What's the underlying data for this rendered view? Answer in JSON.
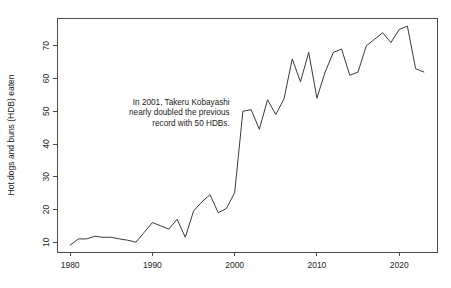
{
  "chart_data": {
    "type": "line",
    "title": "",
    "subtitle": "",
    "xlabel": "",
    "ylabel": "Hot dogs and buns (HDB) eaten",
    "xlim": [
      1978.4,
      2024.6
    ],
    "ylim": [
      7.0,
      78.5
    ],
    "grid": false,
    "legend": null,
    "x_ticks": [
      1980,
      1990,
      2000,
      2010,
      2020
    ],
    "x_tick_labels": [
      "1980",
      "1990",
      "2000",
      "2010",
      "2020"
    ],
    "y_ticks": [
      10,
      20,
      30,
      40,
      50,
      60,
      70
    ],
    "y_tick_labels": [
      "10",
      "20",
      "30",
      "40",
      "50",
      "60",
      "70"
    ],
    "series": [
      {
        "name": "Winning total (HDB)",
        "x": [
          1980,
          1981,
          1982,
          1983,
          1984,
          1985,
          1986,
          1987,
          1988,
          1989,
          1990,
          1991,
          1992,
          1993,
          1994,
          1995,
          1996,
          1997,
          1998,
          1999,
          2000,
          2001,
          2002,
          2003,
          2004,
          2005,
          2006,
          2007,
          2008,
          2009,
          2010,
          2011,
          2012,
          2013,
          2014,
          2015,
          2016,
          2017,
          2018,
          2019,
          2020,
          2021,
          2022,
          2023
        ],
        "values": [
          9.1,
          11.0,
          11.0,
          11.8,
          11.5,
          11.5,
          11.0,
          10.6,
          10.0,
          13.0,
          16.0,
          15.0,
          14.0,
          17.0,
          11.5,
          19.5,
          22.3,
          24.5,
          19.0,
          20.3,
          25.1,
          50.0,
          50.5,
          44.5,
          53.5,
          49.0,
          53.8,
          66.0,
          59.0,
          68.0,
          54.0,
          62.0,
          68.0,
          69.0,
          61.0,
          62.0,
          70.0,
          72.0,
          74.0,
          71.0,
          75.0,
          76.0,
          63.0,
          62.0
        ]
      }
    ],
    "annotations": [
      {
        "name": "kobayashi-2001-note",
        "lines": [
          "In 2001, Takeru Kobayashi",
          "nearly doubled the previous",
          "record with 50 HDBs."
        ],
        "align": "right",
        "anchor_x": 2000,
        "anchor_y": 52
      }
    ]
  }
}
